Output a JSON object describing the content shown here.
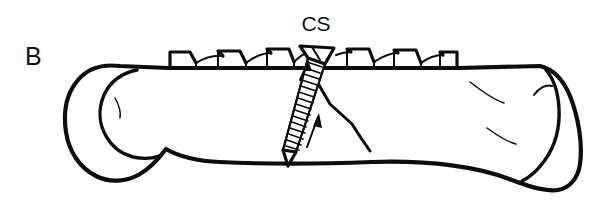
{
  "figure": {
    "panel_label": "B",
    "callouts": [
      {
        "id": "cs",
        "text": "CS",
        "meaning": "compression-screw",
        "x": 316,
        "y": 31
      }
    ],
    "background_color": "#ffffff",
    "ink_color": "#0d0d0d",
    "canvas": {
      "width": 607,
      "height": 211
    }
  },
  "illustration": {
    "subject": "lateral view of a long bone with oblique fracture fixed by a toothed dorsal plate and an oblique compression screw",
    "view": "lateral",
    "style": "black ink line drawing",
    "parts": [
      {
        "name": "bone-shaft",
        "label": ""
      },
      {
        "name": "bone-proximal-end",
        "label": ""
      },
      {
        "name": "bone-distal-end",
        "label": ""
      },
      {
        "name": "toothed-plate",
        "label": ""
      },
      {
        "name": "compression-screw",
        "label": "CS"
      },
      {
        "name": "fracture-line",
        "label": ""
      },
      {
        "name": "compression-arrow-upper",
        "label": ""
      },
      {
        "name": "compression-arrow-lower",
        "label": ""
      }
    ]
  },
  "plate": {
    "name": "toothed-fixation-plate",
    "tooth_count_left": 4,
    "tooth_count_right": 3,
    "x_start": 168,
    "x_end": 459,
    "top_y": 50,
    "base_y": 68
  },
  "screw": {
    "name": "compression-screw",
    "abbreviation": "CS",
    "head_type": "countersunk-conical",
    "head_x": 318,
    "head_y": 54,
    "tip_x": 285,
    "tip_y": 156,
    "thread_count": 17,
    "orientation": "oblique"
  },
  "fracture": {
    "name": "oblique-fracture-line",
    "start_x": 309,
    "start_y": 62,
    "end_x": 372,
    "end_y": 152
  }
}
